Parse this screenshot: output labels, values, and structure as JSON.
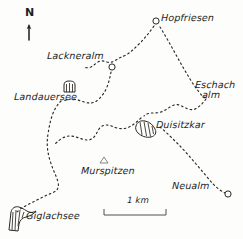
{
  "map": {
    "title": "Hand-drawn hiking map",
    "region": "Schladminger Tauern",
    "background_color": "#fdfdfc",
    "ink_color": "#2b2724",
    "orientation": {
      "label": "N",
      "icon": "north-arrow-icon"
    },
    "scale": {
      "label": "1 km",
      "bar_length_px": 62
    },
    "places": [
      {
        "id": "hopfriesen",
        "label": "Hopfriesen",
        "type": "hut",
        "marker": "circle",
        "marker_x": 156,
        "marker_y": 21,
        "label_x": 161,
        "label_y": 13
      },
      {
        "id": "lackneralm",
        "label": "Lackneralm",
        "type": "hut",
        "marker": "circle",
        "marker_x": 112,
        "marker_y": 67,
        "label_x": 47,
        "label_y": 51
      },
      {
        "id": "landauersee",
        "label": "Landauersee",
        "type": "lake",
        "marker": "lake-hatched",
        "marker_x": 70,
        "marker_y": 88,
        "label_x": 14,
        "label_y": 92
      },
      {
        "id": "eschachalm",
        "label": "Eschach alm",
        "label_line_1": "Eschach",
        "label_line_2": "alm",
        "type": "hut",
        "marker": "none",
        "label_x": 195,
        "label_y": 80
      },
      {
        "id": "duisitzkar",
        "label": "Duisitzkar",
        "type": "lake",
        "marker": "lake-hatched",
        "marker_x": 144,
        "marker_y": 128,
        "label_x": 156,
        "label_y": 120
      },
      {
        "id": "murspitzen",
        "label": "Murspitzen",
        "type": "peak",
        "marker": "peak-triangle",
        "marker_x": 104,
        "marker_y": 160,
        "label_x": 81,
        "label_y": 166
      },
      {
        "id": "neualm",
        "label": "Neualm",
        "type": "hut",
        "marker": "circle",
        "marker_x": 228,
        "marker_y": 194,
        "label_x": 172,
        "label_y": 181
      },
      {
        "id": "giglachsee",
        "label": "Giglachsee",
        "type": "lake",
        "marker": "lake-hatched",
        "marker_x": 16,
        "marker_y": 214,
        "label_x": 26,
        "label_y": 211
      }
    ],
    "trails": [
      {
        "id": "trail-hopfriesen-lackneralm",
        "from": "hopfriesen",
        "to": "lackneralm",
        "style": "dashed"
      },
      {
        "id": "trail-hopfriesen-eschachalm",
        "from": "hopfriesen",
        "to": "eschachalm",
        "style": "dashed"
      },
      {
        "id": "trail-lackneralm-landauersee",
        "from": "lackneralm",
        "to": "landauersee",
        "style": "dashed"
      },
      {
        "id": "trail-landauersee-murspitzen-giglachsee",
        "from": "landauersee",
        "to": "giglachsee",
        "style": "dashed"
      },
      {
        "id": "trail-eschachalm-duisitzkar",
        "from": "eschachalm",
        "to": "duisitzkar",
        "style": "dashed"
      },
      {
        "id": "trail-duisitzkar-neualm",
        "from": "duisitzkar",
        "to": "neualm",
        "style": "dashed"
      },
      {
        "id": "trail-duisitzkar-murspitzen",
        "from": "duisitzkar",
        "to": "murspitzen",
        "style": "dashed"
      }
    ]
  }
}
